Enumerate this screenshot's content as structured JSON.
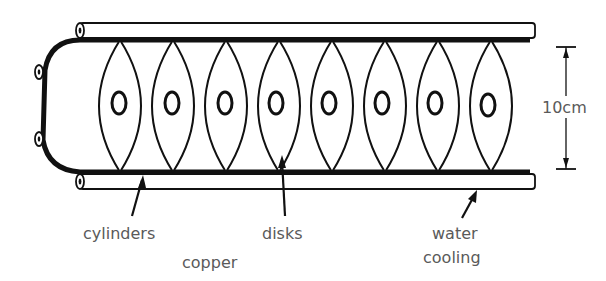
{
  "diagram": {
    "disk_count": 8,
    "colors": {
      "ink": "#111111",
      "label": "#5a5a5a",
      "background": "#ffffff"
    }
  },
  "labels": {
    "cylinders": "cylinders",
    "copper": "copper",
    "disks": "disks",
    "water": "water",
    "cooling": "cooling",
    "dimension": "10cm"
  }
}
